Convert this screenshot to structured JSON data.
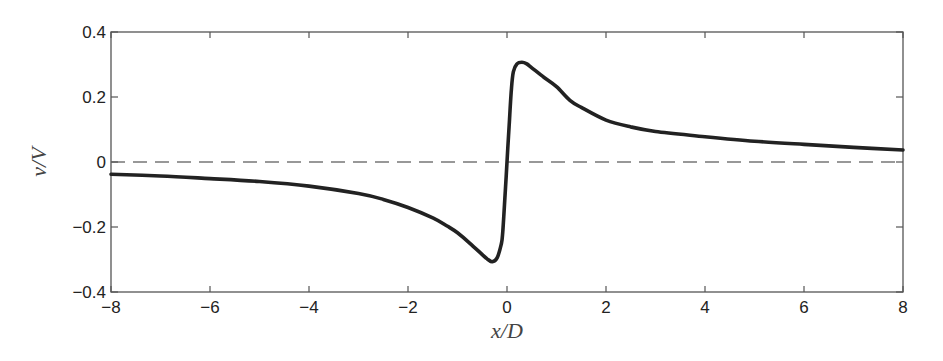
{
  "chart_data": {
    "type": "line",
    "title": "",
    "xlabel": "x/D",
    "ylabel": "v/V",
    "xlim": [
      -8,
      8
    ],
    "ylim": [
      -0.4,
      0.4
    ],
    "grid": false,
    "legend": null,
    "xticks": [
      -8,
      -6,
      -4,
      -2,
      0,
      2,
      4,
      6,
      8
    ],
    "xtick_labels": [
      "−8",
      "−6",
      "−4",
      "−2",
      "0",
      "2",
      "4",
      "6",
      "8"
    ],
    "yticks": [
      -0.4,
      -0.2,
      0,
      0.2,
      0.4
    ],
    "ytick_labels": [
      "−0.4",
      "−0.2",
      "0",
      "0.2",
      "0.4"
    ],
    "series": [
      {
        "name": "v/V",
        "style": "solid-thick",
        "color": "#222222",
        "x": [
          -8,
          -7,
          -6,
          -5,
          -4,
          -3,
          -2.5,
          -2,
          -1.5,
          -1.2,
          -1.0,
          -0.75,
          -0.5,
          -0.4,
          -0.3,
          -0.2,
          -0.12,
          -0.09,
          -0.05,
          0,
          0.05,
          0.09,
          0.13,
          0.2,
          0.3,
          0.4,
          0.5,
          0.75,
          1.0,
          1.27,
          1.5,
          2,
          2.5,
          3,
          4,
          5,
          6,
          7,
          8
        ],
        "values": [
          -0.038,
          -0.043,
          -0.051,
          -0.06,
          -0.074,
          -0.097,
          -0.115,
          -0.14,
          -0.172,
          -0.198,
          -0.218,
          -0.25,
          -0.285,
          -0.298,
          -0.307,
          -0.295,
          -0.255,
          -0.225,
          -0.13,
          0,
          0.13,
          0.227,
          0.278,
          0.302,
          0.307,
          0.302,
          0.29,
          0.26,
          0.232,
          0.19,
          0.168,
          0.129,
          0.108,
          0.094,
          0.078,
          0.064,
          0.054,
          0.045,
          0.037
        ]
      },
      {
        "name": "zero reference",
        "style": "dashed",
        "color": "#777777",
        "x": [
          -8,
          8
        ],
        "values": [
          0,
          0
        ]
      }
    ]
  }
}
